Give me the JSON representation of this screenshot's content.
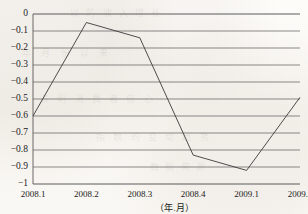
{
  "chart_data": {
    "type": "line",
    "title": "",
    "subtitle": "",
    "xlabel": "（年.月）",
    "ylabel": "",
    "categories": [
      "2008.1",
      "2008.2",
      "2008.3",
      "2008.4",
      "2009.1",
      "2009.2"
    ],
    "values": [
      -0.6,
      -0.05,
      -0.14,
      -0.83,
      -0.92,
      -0.49
    ],
    "series": [
      {
        "name": "",
        "values": [
          -0.6,
          -0.05,
          -0.14,
          -0.83,
          -0.92,
          -0.49
        ]
      }
    ],
    "ylim": [
      -1,
      0
    ],
    "xlim": [
      0,
      5
    ],
    "ytick_labels": [
      "0",
      "-0.1",
      "-0.2",
      "-0.3",
      "-0.4",
      "-0.5",
      "-0.6",
      "-0.7",
      "-0.8",
      "-0.9",
      "-1"
    ],
    "ytick_values": [
      0,
      -0.1,
      -0.2,
      -0.3,
      -0.4,
      -0.5,
      -0.6,
      -0.7,
      -0.8,
      -0.9,
      -1
    ],
    "xtick_labels": [
      "2008.1",
      "2008.2",
      "2008.3",
      "2008.4",
      "2009.1",
      "2009.2"
    ],
    "grid": true,
    "grid_axis": "y",
    "legend": false,
    "legend_position": "none",
    "line_color": "#3a3a3a",
    "grid_color": "#5a5a5a",
    "markers": false,
    "annotations": []
  },
  "figure": {
    "background_color": "#faf8f4",
    "text_color": "#1a1a1a"
  },
  "ghost_text": {
    "line1": "以 的 收 入 增 长",
    "line2": "年 月 份 以 来",
    "line3": "表 明 消 费 者 信 心",
    "line4": "指 数 的 变 动 趋 势",
    "line5": "数 据 来 源"
  }
}
